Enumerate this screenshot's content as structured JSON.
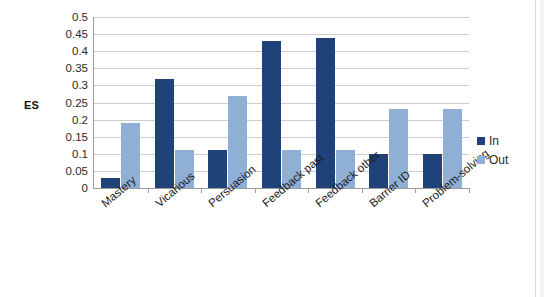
{
  "chart_data": {
    "type": "bar",
    "title": "",
    "xlabel": "",
    "ylabel": "ES",
    "ylim": [
      0,
      0.5
    ],
    "yticks": [
      "0",
      "0.05",
      "0.1",
      "0.15",
      "0.2",
      "0.25",
      "0.3",
      "0.35",
      "0.4",
      "0.45",
      "0.5"
    ],
    "ytick_values": [
      0,
      0.05,
      0.1,
      0.15,
      0.2,
      0.25,
      0.3,
      0.35,
      0.4,
      0.45,
      0.5
    ],
    "grid": true,
    "legend_position": "right",
    "categories": [
      "Mastery",
      "Vicarious",
      "Persuasion",
      "Feedback past",
      "Feedback other",
      "Barrier ID",
      "Problem-solving"
    ],
    "series": [
      {
        "name": "In",
        "color": "#1f4379",
        "values": [
          0.03,
          0.32,
          0.11,
          0.43,
          0.44,
          0.1,
          0.1
        ]
      },
      {
        "name": "Out",
        "color": "#8fafd4",
        "values": [
          0.19,
          0.11,
          0.27,
          0.11,
          0.11,
          0.23,
          0.23
        ]
      }
    ]
  },
  "legend": {
    "items": [
      {
        "label": "In",
        "swatch": "in"
      },
      {
        "label": "Out",
        "swatch": "out"
      }
    ]
  },
  "colors": {
    "series_in": "#1f4379",
    "series_out": "#8fafd4",
    "gridline": "#cdcdcd",
    "axis": "#9b9b9b",
    "background": "#ffffff"
  }
}
